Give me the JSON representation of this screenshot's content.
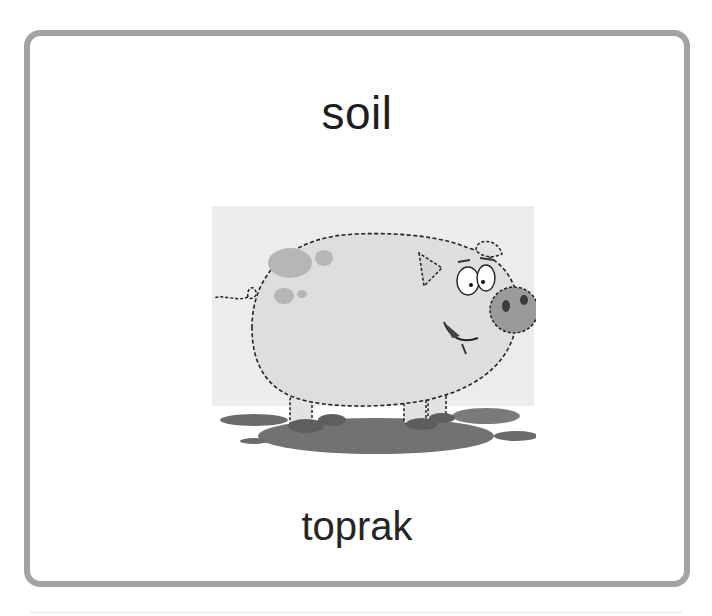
{
  "flashcard": {
    "word": "soil",
    "translation": "toprak",
    "image": {
      "description": "cartoon pig standing in a mud puddle",
      "icon": "pig-in-mud-illustration"
    },
    "colors": {
      "border": "#a3a3a3",
      "background": "#ffffff",
      "text": "#1e1e1e",
      "image_background": "#ececec",
      "pig_body": "#dedede",
      "pig_spots": "#b4b4b4",
      "mud": "#6e6e6e"
    }
  }
}
